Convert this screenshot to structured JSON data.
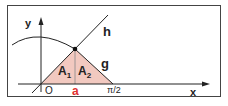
{
  "labels": {
    "y_axis": "y",
    "x_axis": "x",
    "line_h": "h",
    "line_g": "g",
    "area1": "A",
    "area1_sub": "1",
    "area2": "A",
    "area2_sub": "2",
    "origin": "O",
    "point_a": "a",
    "right_end": "π/2"
  },
  "colors": {
    "fill": "#f2c9c0",
    "accent": "#e03030",
    "stroke": "#222222"
  }
}
